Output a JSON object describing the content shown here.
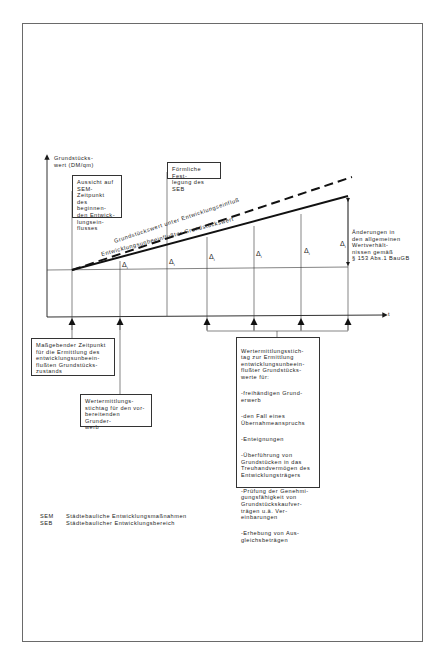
{
  "figure": {
    "y_axis_label": "Grundstücks-\nwert (DM/qm)",
    "x_axis_label": "t",
    "curve_upper_label": "Grundstückswert unter Entwicklungseinfluß",
    "curve_lower_label": "Entwicklungsunbeeinflußter Grundstückswert",
    "delta_symbol": "Δ",
    "delta_subscript": "i",
    "box_top_left": "Aussicht auf\nSEM-Zeitpunkt\ndes beginnen-\nden Entwick-\nlungsein-\nflusses",
    "box_top_mid": "Förmliche Fest-\nlegung des SEB",
    "note_right": "Änderungen in\nden allgemeinen\nWertverhält-\nnissen gemäß\n§ 153 Abs.1 BauGB",
    "box_bottom_left": "Maßgebender Zeitpunkt\nfür die Ermittlung des\nentwicklungsunbeein-\nflußten Grundstücks-\nzustands",
    "box_bottom_mid": "Wertermittlungs-\nstichtag für den vor-\nbereitenden Grunder-\nwerb",
    "box_bottom_right": {
      "intro": "Wertermittlungsstich-\ntag zur Ermittlung\nentwicklungsunbeein-\nflußter Grundstücks-\nwerte für:",
      "items": [
        "-freihändigen Grund-\n erwerb",
        "-den Fall eines\n Übernahmeanspruchs",
        "-Enteignungen",
        "-Überführung von\n Grundstücken in das\n Treuhandvermögen des\n Entwicklungsträgers",
        "-Prüfung der Genehmi-\n gungsfähigkeit von\n Grundstückskaufver-\n trägen u.ä. Ver-\n einbarungen",
        "-Erhebung von Aus-\n gleichsbeträgen"
      ]
    }
  },
  "legend": [
    {
      "abbr": "SEM",
      "text": "Städtebauliche Entwicklungsmaßnahmen"
    },
    {
      "abbr": "SEB",
      "text": "Städtebaulicher Entwicklungsbereich"
    }
  ],
  "colors": {
    "line": "#1a1a1a",
    "frame": "#6a6a6a"
  }
}
